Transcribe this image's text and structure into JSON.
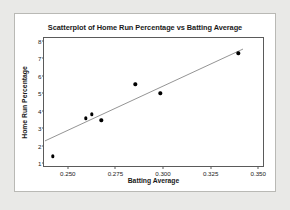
{
  "figure": {
    "background_color": "#e9e9e7",
    "panel_color": "#ffffff",
    "border_color": "#b9b9b5"
  },
  "chart_data": {
    "type": "scatter",
    "title": "Scatterplot of Home Run Percentage vs Batting Average",
    "xlabel": "Batting Average",
    "ylabel": "Home Run Percentage",
    "xlim": [
      0.2375,
      0.3525
    ],
    "ylim": [
      0.85,
      8.15
    ],
    "grid": false,
    "legend": null,
    "xticks": [
      0.25,
      0.275,
      0.3,
      0.325,
      0.35
    ],
    "xtick_labels": [
      "0.250",
      "0.275",
      "0.300",
      "0.325",
      "0.350"
    ],
    "yticks": [
      1,
      2,
      3,
      4,
      5,
      6,
      7,
      8
    ],
    "ytick_labels": [
      "1",
      "2",
      "3",
      "4",
      "5",
      "6",
      "7",
      "8"
    ],
    "marker_color": "#000000",
    "line_color": "#3a3a3a",
    "points": [
      {
        "x": 0.242,
        "y": 1.4
      },
      {
        "x": 0.2595,
        "y": 3.58
      },
      {
        "x": 0.2625,
        "y": 3.8
      },
      {
        "x": 0.2675,
        "y": 3.46
      },
      {
        "x": 0.2855,
        "y": 5.5
      },
      {
        "x": 0.2985,
        "y": 5.0
      },
      {
        "x": 0.3395,
        "y": 7.28
      }
    ],
    "fit_line": {
      "label": "regression-line",
      "x_start": 0.238,
      "y_start": 2.28,
      "x_end": 0.342,
      "y_end": 7.52
    }
  }
}
